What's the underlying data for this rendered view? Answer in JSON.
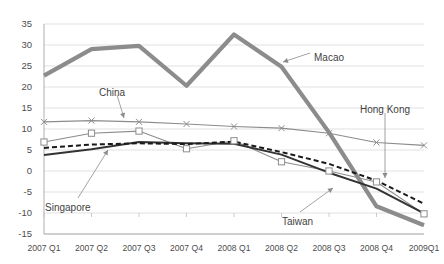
{
  "chart_data": {
    "type": "line",
    "title": "",
    "subtitle": "",
    "xlabel": "",
    "ylabel": "",
    "ylim": [
      -15,
      35
    ],
    "ytick_step": 5,
    "grid": true,
    "legend_position": "inline-annotations",
    "categories": [
      "2007 Q1",
      "2007 Q2",
      "2007 Q3",
      "2007 Q4",
      "2008 Q1",
      "2008 Q2",
      "2008 Q3",
      "2008 Q4",
      "2009Q1"
    ],
    "yticks": [
      "35",
      "30",
      "25",
      "20",
      "15",
      "10",
      "5",
      "0",
      "-5",
      "-10",
      "-15"
    ],
    "series": [
      {
        "name": "Macao",
        "color": "#8c8c8c",
        "style": "thick-solid",
        "marker": "none",
        "values": [
          22.7,
          29.0,
          29.8,
          20.3,
          32.5,
          24.8,
          9.2,
          -8.4,
          -12.9
        ]
      },
      {
        "name": "China",
        "color": "#8c8c8c",
        "style": "thin-solid",
        "marker": "x",
        "values": [
          11.7,
          12.0,
          11.7,
          11.2,
          10.6,
          10.2,
          9.0,
          6.8,
          6.1
        ]
      },
      {
        "name": "Hong Kong",
        "color": "#8c8c8c",
        "style": "thin-solid",
        "marker": "square",
        "values": [
          6.9,
          9.0,
          9.5,
          5.3,
          7.2,
          2.2,
          0.0,
          -2.6,
          -10.2
        ]
      },
      {
        "name": "Singapore",
        "color": "#333333",
        "style": "medium-solid",
        "marker": "none",
        "values": [
          3.8,
          5.2,
          6.9,
          6.6,
          6.5,
          3.9,
          -0.4,
          -4.2,
          -10.1
        ]
      },
      {
        "name": "Taiwan",
        "color": "#1a1a1a",
        "style": "dashed",
        "marker": "none",
        "values": [
          5.5,
          6.3,
          6.6,
          6.4,
          7.0,
          4.5,
          1.7,
          -2.3,
          -7.8
        ]
      }
    ],
    "annotations": [
      {
        "label": "Macao",
        "x": 314,
        "y": 52
      },
      {
        "label": "China",
        "x": 99,
        "y": 87
      },
      {
        "label": "Hong Kong",
        "x": 360,
        "y": 104
      },
      {
        "label": "Singapore",
        "x": 45,
        "y": 202
      },
      {
        "label": "Taiwan",
        "x": 282,
        "y": 216
      }
    ]
  }
}
